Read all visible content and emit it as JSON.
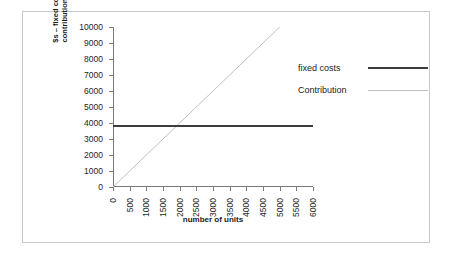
{
  "chart_data": {
    "type": "line",
    "title": "",
    "xlabel": "number of units",
    "ylabel": "$s – fixed costs and\ncontribution/margin",
    "xlim": [
      0,
      6000
    ],
    "ylim": [
      0,
      10000
    ],
    "grid": false,
    "legend_position": "right",
    "x_ticks": [
      "0",
      "500",
      "1000",
      "1500",
      "2000",
      "2500",
      "3000",
      "3500",
      "4000",
      "4500",
      "5000",
      "5500",
      "6000"
    ],
    "y_ticks": [
      "0",
      "1000",
      "2000",
      "3000",
      "4000",
      "5000",
      "6000",
      "7000",
      "8000",
      "9000",
      "10000"
    ],
    "series": [
      {
        "name": "fixed costs",
        "style": "thick-dark",
        "color": "#3c3c3c",
        "x": [
          0,
          6000
        ],
        "values": [
          3850,
          3850
        ]
      },
      {
        "name": "Contribution",
        "style": "thin-light",
        "color": "#c0c0c0",
        "x": [
          0,
          5000
        ],
        "values": [
          0,
          10000
        ]
      }
    ],
    "legend": [
      {
        "label": "fixed costs",
        "swatch": "thick"
      },
      {
        "label": "Contribution",
        "swatch": "thin"
      }
    ]
  },
  "figure": {
    "y_axis_title_line1": "$s – fixed costs and",
    "y_axis_title_line2": "contribution/margin",
    "x_axis_title": "number of units"
  }
}
